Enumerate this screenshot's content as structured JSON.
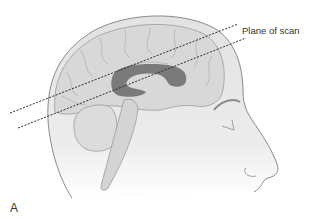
{
  "diagram": {
    "type": "anatomical-illustration",
    "labels": {
      "scan_plane": "Plane of scan",
      "panel": "A"
    },
    "structures": [
      "head-outline",
      "cerebrum",
      "lateral-ventricle",
      "cerebellum",
      "brainstem",
      "face-profile"
    ],
    "scan_lines": [
      {
        "x1": 10,
        "y1": 113,
        "x2": 238,
        "y2": 24
      },
      {
        "x1": 18,
        "y1": 128,
        "x2": 246,
        "y2": 38
      }
    ],
    "colors": {
      "head_fill": "#e6e6e6",
      "brain_fill": "#d9d9d9",
      "outline": "#8a8a8a",
      "ventricle": "#7a7a7a",
      "scan_line": "#2a2a2a"
    }
  }
}
